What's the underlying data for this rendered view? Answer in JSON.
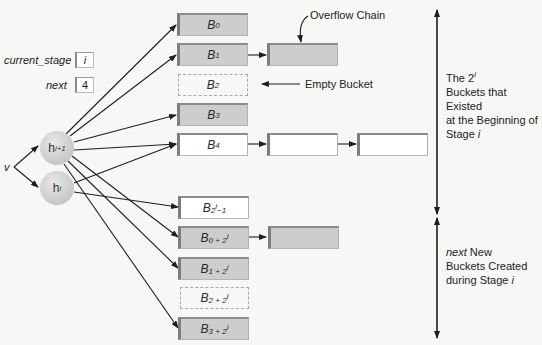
{
  "variables": {
    "current_stage": {
      "label": "current_stage",
      "value": "i"
    },
    "next": {
      "label": "next",
      "value": "4"
    }
  },
  "input": {
    "label": "v"
  },
  "hash_functions": [
    {
      "name": "h",
      "sub": "i+1"
    },
    {
      "name": "h",
      "sub": "i"
    }
  ],
  "buckets": [
    {
      "base": "B",
      "sub": "0",
      "sup": "",
      "sub2": "",
      "state": "full"
    },
    {
      "base": "B",
      "sub": "1",
      "sup": "",
      "sub2": "",
      "state": "full"
    },
    {
      "base": "B",
      "sub": "2",
      "sup": "",
      "sub2": "",
      "state": "empty"
    },
    {
      "base": "B",
      "sub": "3",
      "sup": "",
      "sub2": "",
      "state": "full"
    },
    {
      "base": "B",
      "sub": "4",
      "sup": "",
      "sub2": "",
      "state": "open"
    },
    {
      "base": "B",
      "sub": "2",
      "sup": "i",
      "sub2": "−1",
      "state": "open"
    },
    {
      "base": "B",
      "sub": "0 + 2",
      "sup": "i",
      "sub2": "",
      "state": "full"
    },
    {
      "base": "B",
      "sub": "1 + 2",
      "sup": "i",
      "sub2": "",
      "state": "full"
    },
    {
      "base": "B",
      "sub": "2 + 2",
      "sup": "i",
      "sub2": "",
      "state": "empty"
    },
    {
      "base": "B",
      "sub": "3 + 2",
      "sup": "i",
      "sub2": "",
      "state": "full"
    }
  ],
  "annotations": {
    "overflow_chain": "Overflow Chain",
    "empty_bucket": "Empty Bucket"
  },
  "brackets": {
    "existing": {
      "line1_prefix": "The 2",
      "line1_sup": "i",
      "line2": "Buckets that Existed",
      "line3": "at the Beginning of",
      "line4_prefix": "Stage ",
      "line4_var": "i"
    },
    "new": {
      "line1_var": "next",
      "line1_rest": " New",
      "line2": "Buckets Created",
      "line3_prefix": "during Stage ",
      "line3_var": "i"
    }
  },
  "colors": {
    "full_bucket": "#cdcdcd",
    "open_bucket": "#ffffff",
    "line": "#1e1e1e",
    "background": "#f7f7f6"
  }
}
